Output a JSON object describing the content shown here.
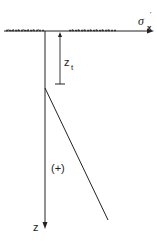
{
  "diagram": {
    "title": "",
    "labels": {
      "x_axis": "σ",
      "x_axis_sub": "x",
      "x_axis_prime": "'",
      "z_axis": "z",
      "depth_label": "z",
      "depth_label_sub": "t",
      "sign_label": "(+)"
    },
    "elements": {
      "ground_surface": "hatched ground line at z = 0",
      "vertical_axis": "z axis pointing downward",
      "horizontal_axis": "σ'x axis pointing right",
      "depth_dimension": "dimension from surface to depth z_t",
      "stress_line": "linear stress distribution starting at z_t, increasing with depth"
    },
    "colors": {
      "ink": "#222222",
      "background": "#ffffff"
    }
  }
}
